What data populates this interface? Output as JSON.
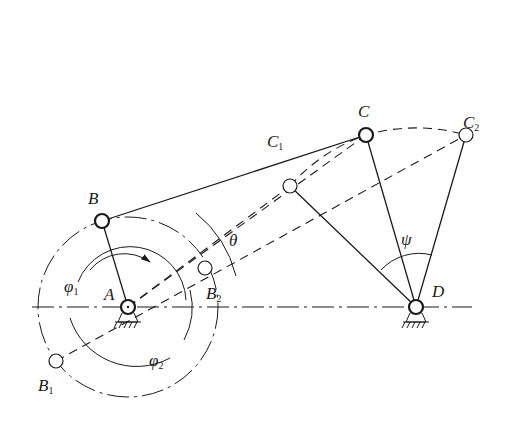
{
  "diagram": {
    "type": "crank-rocker four-bar linkage extreme positions",
    "labels": {
      "A": {
        "text": "A",
        "sub": ""
      },
      "B": {
        "text": "B",
        "sub": ""
      },
      "B1": {
        "text": "B",
        "sub": "1"
      },
      "B2": {
        "text": "B",
        "sub": "2"
      },
      "C": {
        "text": "C",
        "sub": ""
      },
      "C1": {
        "text": "C",
        "sub": "1"
      },
      "C2": {
        "text": "C",
        "sub": "2"
      },
      "D": {
        "text": "D",
        "sub": ""
      },
      "phi1": {
        "text": "φ",
        "sub": "1"
      },
      "phi2": {
        "text": "φ",
        "sub": "2"
      },
      "theta": {
        "text": "θ",
        "sub": ""
      },
      "psi": {
        "text": "ψ",
        "sub": ""
      }
    },
    "points": {
      "A": [
        128,
        307
      ],
      "B": [
        102,
        221
      ],
      "B1": [
        56,
        361
      ],
      "B2": [
        205,
        268
      ],
      "C": [
        366,
        135
      ],
      "C1": [
        290,
        186
      ],
      "C2": [
        466,
        135
      ],
      "D": [
        416,
        307
      ]
    },
    "colors": {
      "stroke": "#1a1a1a",
      "background": "#ffffff"
    }
  }
}
